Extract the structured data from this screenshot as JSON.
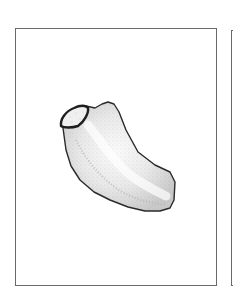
{
  "figure": {
    "panels": [
      {
        "id": "main",
        "content": "specimen-drawing"
      },
      {
        "id": "next",
        "content": "partial-frame"
      }
    ],
    "specimen": {
      "description": "stippled illustration of a curved, elongated specimen with a dark-rimmed oval cap at upper left",
      "outline_color": "#2a2a2a",
      "fill_color": "#ececec",
      "stipple_color": "#9a9a9a"
    },
    "frame_color": "#6a6a6a",
    "background_color": "#ffffff"
  }
}
